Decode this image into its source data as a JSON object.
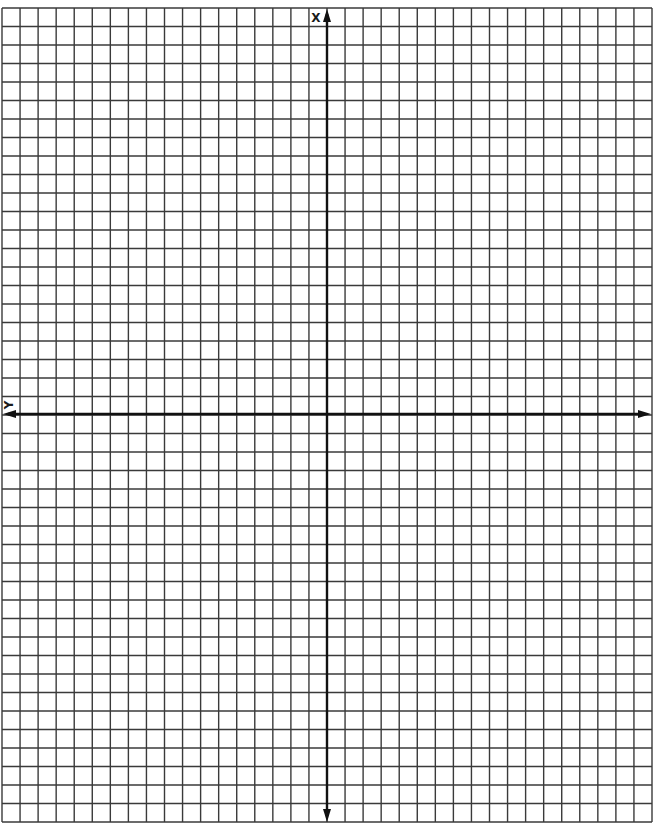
{
  "diagram": {
    "type": "coordinate-grid",
    "grid": {
      "columns": 36,
      "rows": 44,
      "origin_column": 18,
      "origin_row": 22,
      "line_color": "#3a3a3a",
      "axis_color": "#111111",
      "background": "#ffffff"
    },
    "axes": {
      "vertical_label": "X",
      "horizontal_label": "Y",
      "vertical_arrows": [
        "up",
        "down"
      ],
      "horizontal_arrows": [
        "left",
        "right"
      ]
    }
  }
}
